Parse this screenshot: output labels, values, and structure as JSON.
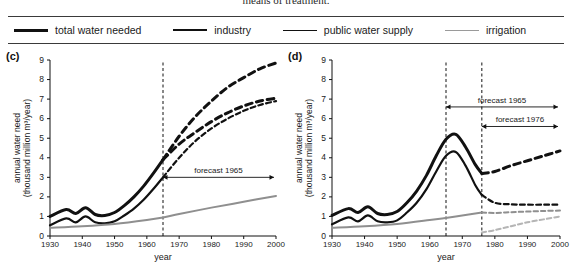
{
  "caption": {
    "text": "means of treatment."
  },
  "legend": {
    "items": [
      {
        "label": "total water needed",
        "color": "#111111",
        "width": 3.2,
        "dash": "none",
        "name": "legend-total-water-needed"
      },
      {
        "label": "industry",
        "color": "#111111",
        "width": 2.4,
        "dash": "none",
        "name": "legend-industry"
      },
      {
        "label": "public water supply",
        "color": "#111111",
        "width": 1.6,
        "dash": "none",
        "name": "legend-public-water-supply"
      },
      {
        "label": "irrigation",
        "color": "#9a9a9a",
        "width": 1.6,
        "dash": "none",
        "name": "legend-irrigation"
      }
    ]
  },
  "chart_data": [
    {
      "id": "c",
      "type": "line",
      "panel_label": "(c)",
      "title": "",
      "xlabel": "year",
      "ylabel": "annual water need",
      "ylabel_units": "(thousand million m³/year)",
      "xlim": [
        1930,
        2000
      ],
      "ylim": [
        0,
        9
      ],
      "xticks": [
        1930,
        1940,
        1950,
        1960,
        1970,
        1980,
        1990,
        2000
      ],
      "yticks": [
        0,
        1,
        2,
        3,
        4,
        5,
        6,
        7,
        8,
        9
      ],
      "grid": false,
      "forecast_line_year": 1965,
      "annotations": [
        {
          "text": "forecast 1965",
          "year_from": 1965,
          "year_to": 2000,
          "y": 3.0
        }
      ],
      "series": [
        {
          "name": "total water needed (upper forecast)",
          "style": "solid-then-dashed",
          "color": "#111111",
          "width": 3.0,
          "x": [
            1930,
            1935,
            1938,
            1941,
            1944,
            1947,
            1950,
            1953,
            1956,
            1959,
            1962,
            1965,
            1970,
            1975,
            1980,
            1985,
            1990,
            1995,
            2000
          ],
          "values": [
            1.0,
            1.35,
            1.15,
            1.45,
            1.1,
            1.05,
            1.2,
            1.55,
            2.0,
            2.55,
            3.2,
            3.9,
            5.1,
            6.1,
            6.9,
            7.6,
            8.1,
            8.55,
            8.85
          ]
        },
        {
          "name": "total water needed (lower forecast)",
          "style": "dashed",
          "color": "#111111",
          "width": 3.0,
          "x": [
            1965,
            1970,
            1975,
            1980,
            1985,
            1990,
            1995,
            2000
          ],
          "values": [
            3.9,
            4.7,
            5.3,
            5.85,
            6.3,
            6.65,
            6.9,
            7.05
          ]
        },
        {
          "name": "industry (upper forecast)",
          "style": "solid-then-dashed",
          "color": "#111111",
          "width": 2.2,
          "x": [
            1930,
            1935,
            1938,
            1941,
            1944,
            1947,
            1950,
            1953,
            1956,
            1959,
            1962,
            1965,
            1970,
            1975,
            1980,
            1985,
            1990,
            1995,
            2000
          ],
          "values": [
            0.55,
            0.9,
            0.7,
            1.0,
            0.7,
            0.65,
            0.75,
            1.05,
            1.4,
            1.85,
            2.4,
            3.0,
            4.0,
            4.85,
            5.5,
            6.0,
            6.4,
            6.7,
            6.9
          ]
        },
        {
          "name": "public water supply",
          "style": "solid",
          "color": "#8f8f8f",
          "width": 2.0,
          "x": [
            1930,
            1940,
            1950,
            1960,
            1965,
            1970,
            1980,
            1990,
            2000
          ],
          "values": [
            0.42,
            0.5,
            0.62,
            0.82,
            0.95,
            1.12,
            1.45,
            1.75,
            2.05
          ]
        }
      ]
    },
    {
      "id": "d",
      "type": "line",
      "panel_label": "(d)",
      "title": "",
      "xlabel": "year",
      "ylabel": "annual water need",
      "ylabel_units": "(thousand million m³/year)",
      "xlim": [
        1930,
        2000
      ],
      "ylim": [
        0,
        9
      ],
      "xticks": [
        1930,
        1940,
        1950,
        1960,
        1970,
        1980,
        1990,
        2000
      ],
      "yticks": [
        0,
        1,
        2,
        3,
        4,
        5,
        6,
        7,
        8,
        9
      ],
      "grid": false,
      "forecast_lines": [
        1965,
        1976
      ],
      "annotations": [
        {
          "text": "forecast 1965",
          "year_from": 1965,
          "year_to": 2000,
          "y": 6.6
        },
        {
          "text": "forecast 1976",
          "year_from": 1976,
          "year_to": 2000,
          "y": 5.6
        }
      ],
      "series": [
        {
          "name": "total water needed",
          "style": "solid-then-dashed",
          "color": "#111111",
          "width": 3.0,
          "x": [
            1930,
            1935,
            1938,
            1941,
            1944,
            1947,
            1950,
            1953,
            1956,
            1959,
            1962,
            1965,
            1968,
            1971,
            1974,
            1976,
            1980,
            1985,
            1990,
            1995,
            2000
          ],
          "values": [
            1.05,
            1.4,
            1.2,
            1.5,
            1.15,
            1.1,
            1.25,
            1.7,
            2.3,
            3.1,
            4.1,
            4.95,
            5.2,
            4.55,
            3.65,
            3.2,
            3.3,
            3.6,
            3.85,
            4.1,
            4.35
          ]
        },
        {
          "name": "industry",
          "style": "solid-then-dashed",
          "color": "#111111",
          "width": 2.2,
          "x": [
            1930,
            1935,
            1938,
            1941,
            1944,
            1947,
            1950,
            1953,
            1956,
            1959,
            1962,
            1965,
            1968,
            1971,
            1974,
            1976,
            1980,
            1985,
            1990,
            1995,
            2000
          ],
          "values": [
            0.6,
            0.95,
            0.75,
            1.05,
            0.75,
            0.7,
            0.8,
            1.2,
            1.7,
            2.4,
            3.3,
            4.1,
            4.3,
            3.6,
            2.6,
            2.1,
            1.7,
            1.62,
            1.6,
            1.6,
            1.6
          ]
        },
        {
          "name": "public water supply",
          "style": "solid-then-dashed",
          "color": "#8f8f8f",
          "width": 2.0,
          "x": [
            1930,
            1940,
            1950,
            1960,
            1968,
            1976,
            1980,
            1985,
            1990,
            1995,
            2000
          ],
          "values": [
            0.42,
            0.5,
            0.62,
            0.82,
            1.0,
            1.2,
            1.18,
            1.22,
            1.25,
            1.28,
            1.3
          ]
        },
        {
          "name": "irrigation",
          "style": "dashed",
          "color": "#b5b5b5",
          "width": 2.0,
          "x": [
            1976,
            1980,
            1985,
            1990,
            1995,
            2000
          ],
          "values": [
            0.18,
            0.3,
            0.5,
            0.7,
            0.85,
            1.0
          ]
        }
      ]
    }
  ]
}
